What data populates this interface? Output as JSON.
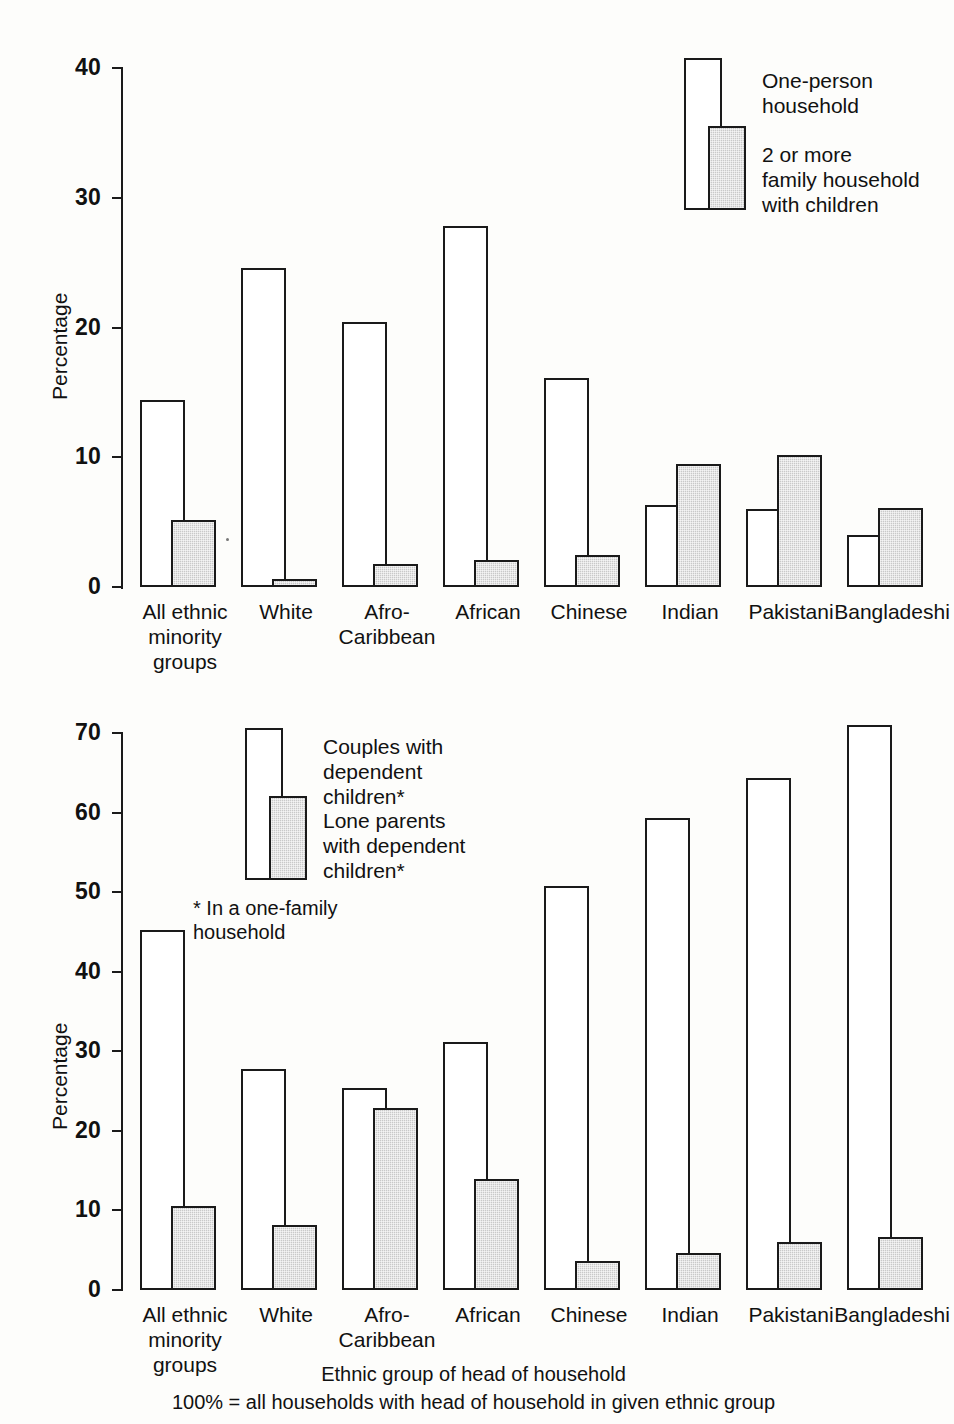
{
  "figure": {
    "footer_line1": "Ethnic group of head of household",
    "footer_line2": "100% = all households with head of household in given ethnic group"
  },
  "chart_data": [
    {
      "type": "bar",
      "title": "",
      "xlabel": "Ethnic group of head of household",
      "ylabel": "Percentage",
      "ylim": [
        0,
        40
      ],
      "yticks": [
        0,
        10,
        20,
        30,
        40
      ],
      "ytick_labels": [
        "0",
        "10",
        "20",
        "30",
        "40"
      ],
      "grid": false,
      "legend_position": "top-right",
      "categories": [
        "All ethnic\nminority\ngroups",
        "White",
        "Afro-\nCaribbean",
        "African",
        "Chinese",
        "Indian",
        "Pakistani",
        "Bangladeshi"
      ],
      "series": [
        {
          "name": "One-person\nhousehold",
          "style": "open",
          "values": [
            14.4,
            24.6,
            20.4,
            27.8,
            16.1,
            6.3,
            6.0,
            4.0
          ]
        },
        {
          "name": "2 or more\nfamily household\nwith children",
          "style": "filled",
          "values": [
            5.2,
            0.6,
            1.8,
            2.1,
            2.5,
            9.5,
            10.2,
            6.1
          ]
        }
      ]
    },
    {
      "type": "bar",
      "title": "",
      "xlabel": "Ethnic group of head of household",
      "ylabel": "Percentage",
      "ylim": [
        0,
        70
      ],
      "yticks": [
        0,
        10,
        20,
        30,
        40,
        50,
        60,
        70
      ],
      "ytick_labels": [
        "0",
        "10",
        "20",
        "30",
        "40",
        "50",
        "60",
        "70"
      ],
      "grid": false,
      "legend_position": "top-left",
      "annotation": "* In a one-family\n   household",
      "categories": [
        "All ethnic\nminority\ngroups",
        "White",
        "Afro-\nCaribbean",
        "African",
        "Chinese",
        "Indian",
        "Pakistani",
        "Bangladeshi"
      ],
      "series": [
        {
          "name": "Couples with\ndependent\nchildren*",
          "style": "open",
          "values": [
            45.2,
            27.8,
            25.4,
            31.2,
            50.8,
            59.3,
            64.3,
            71.0
          ]
        },
        {
          "name": "Lone parents\nwith dependent\nchildren*",
          "style": "filled",
          "values": [
            10.5,
            8.2,
            22.9,
            14.0,
            3.7,
            4.6,
            6.0,
            6.7
          ]
        }
      ]
    }
  ],
  "top_chart": {
    "ylabel": "Percentage",
    "ytick_labels": [
      "40",
      "30",
      "20",
      "10",
      "0"
    ],
    "legend": {
      "entry1": "One-person\nhousehold",
      "entry2": "2 or more\nfamily household\nwith children"
    },
    "categories": [
      "All ethnic\nminority\ngroups",
      "White",
      "Afro-\nCaribbean",
      "African",
      "Chinese",
      "Indian",
      "Pakistani",
      "Bangladeshi"
    ]
  },
  "bottom_chart": {
    "ylabel": "Percentage",
    "ytick_labels": [
      "70",
      "60",
      "50",
      "40",
      "30",
      "20",
      "10",
      "0"
    ],
    "legend": {
      "entry1": "Couples with\ndependent\nchildren*",
      "entry2": "Lone parents\nwith dependent\nchildren*",
      "footnote": "* In a one-family\n   household"
    },
    "categories": [
      "All ethnic\nminority\ngroups",
      "White",
      "Afro-\nCaribbean",
      "African",
      "Chinese",
      "Indian",
      "Pakistani",
      "Bangladeshi"
    ]
  },
  "colors": {
    "ink": "#1a1a1a",
    "fill_gray": "#c9c9c9",
    "open_white": "#ffffff",
    "background": "#fdfdfb"
  }
}
